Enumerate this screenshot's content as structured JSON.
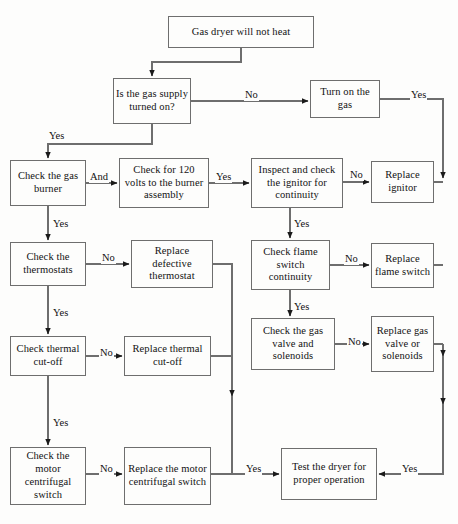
{
  "diagram": {
    "colors": {
      "background": "#fdfdfc",
      "box_border": "#6e6e6e",
      "connector": "#6e6e6e",
      "text": "#121212"
    },
    "nodes": [
      {
        "id": "start",
        "label": "Gas dryer will not heat",
        "x": 168,
        "y": 16,
        "w": 146,
        "h": 32
      },
      {
        "id": "gas-supply",
        "label": "Is the gas supply turned on?",
        "x": 113,
        "y": 78,
        "w": 78,
        "h": 46
      },
      {
        "id": "turn-on-gas",
        "label": "Turn on the gas",
        "x": 310,
        "y": 80,
        "w": 70,
        "h": 38
      },
      {
        "id": "check-gas-burner",
        "label": "Check the gas burner",
        "x": 10,
        "y": 160,
        "w": 76,
        "h": 46
      },
      {
        "id": "check-120-volts",
        "label": "Check for 120 volts to the burner assembly",
        "x": 119,
        "y": 158,
        "w": 90,
        "h": 50
      },
      {
        "id": "inspect-ignitor",
        "label": "Inspect and check the ignitor for continuity",
        "x": 251,
        "y": 158,
        "w": 92,
        "h": 50
      },
      {
        "id": "replace-ignitor",
        "label": "Replace ignitor",
        "x": 371,
        "y": 161,
        "w": 63,
        "h": 42
      },
      {
        "id": "check-thermostats",
        "label": "Check the thermostats",
        "x": 10,
        "y": 242,
        "w": 76,
        "h": 44
      },
      {
        "id": "replace-thermostat",
        "label": "Replace defective thermostat",
        "x": 131,
        "y": 240,
        "w": 82,
        "h": 48
      },
      {
        "id": "check-flame-switch",
        "label": "Check flame switch continuity",
        "x": 251,
        "y": 240,
        "w": 79,
        "h": 50
      },
      {
        "id": "replace-flame-switch",
        "label": "Replace flame switch",
        "x": 371,
        "y": 243,
        "w": 63,
        "h": 45
      },
      {
        "id": "check-thermal",
        "label": "Check thermal cut-off",
        "x": 10,
        "y": 336,
        "w": 76,
        "h": 40
      },
      {
        "id": "replace-thermal",
        "label": "Replace thermal cut-off",
        "x": 124,
        "y": 336,
        "w": 87,
        "h": 40
      },
      {
        "id": "check-gas-valve",
        "label": "Check the gas valve and solenoids",
        "x": 251,
        "y": 318,
        "w": 84,
        "h": 52
      },
      {
        "id": "replace-gas-valve",
        "label": "Replace gas valve or solenoids",
        "x": 371,
        "y": 316,
        "w": 63,
        "h": 56
      },
      {
        "id": "check-motor-switch",
        "label": "Check the motor centrifugal switch",
        "x": 10,
        "y": 447,
        "w": 76,
        "h": 58
      },
      {
        "id": "replace-motor-switch",
        "label": "Replace the motor centrifugal switch",
        "x": 124,
        "y": 447,
        "w": 87,
        "h": 58
      },
      {
        "id": "test-dryer",
        "label": "Test the dryer for proper operation",
        "x": 281,
        "y": 448,
        "w": 96,
        "h": 52
      }
    ],
    "edge_labels": [
      {
        "id": "no-gas-supply",
        "text": "No",
        "x": 244,
        "y": 90
      },
      {
        "id": "yes-turn-on-gas",
        "text": "Yes",
        "x": 410,
        "y": 90
      },
      {
        "id": "yes-gas-supply",
        "text": "Yes",
        "x": 48,
        "y": 131
      },
      {
        "id": "and-burner",
        "text": "And",
        "x": 89,
        "y": 172
      },
      {
        "id": "yes-120-volts",
        "text": "Yes",
        "x": 215,
        "y": 172
      },
      {
        "id": "no-ignitor",
        "text": "No",
        "x": 349,
        "y": 170
      },
      {
        "id": "yes-burner-down",
        "text": "Yes",
        "x": 52,
        "y": 219
      },
      {
        "id": "no-thermostats",
        "text": "No",
        "x": 101,
        "y": 253
      },
      {
        "id": "yes-ignitor-down",
        "text": "Yes",
        "x": 293,
        "y": 219
      },
      {
        "id": "no-flame-switch",
        "text": "No",
        "x": 344,
        "y": 254
      },
      {
        "id": "yes-thermostats-down",
        "text": "Yes",
        "x": 52,
        "y": 308
      },
      {
        "id": "no-thermal",
        "text": "No",
        "x": 99,
        "y": 348
      },
      {
        "id": "yes-flame-down",
        "text": "Yes",
        "x": 293,
        "y": 302
      },
      {
        "id": "no-gas-valve",
        "text": "No",
        "x": 347,
        "y": 337
      },
      {
        "id": "yes-thermal-down",
        "text": "Yes",
        "x": 52,
        "y": 418
      },
      {
        "id": "no-motor-switch",
        "text": "No",
        "x": 99,
        "y": 464
      },
      {
        "id": "yes-left-test",
        "text": "Yes",
        "x": 245,
        "y": 464
      },
      {
        "id": "yes-right-test",
        "text": "Yes",
        "x": 401,
        "y": 464
      }
    ]
  }
}
